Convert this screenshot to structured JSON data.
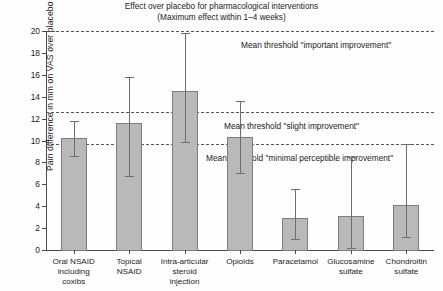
{
  "chart_data": {
    "type": "bar",
    "title": "Effect over placebo for pharmacological interventions",
    "subtitle": "(Maximum effect within 1–4 weeks)",
    "xlabel": "",
    "ylabel": "Pain difference in mm on VAS over placebo",
    "ylim": [
      0,
      20
    ],
    "yticks": [
      0,
      2,
      4,
      6,
      8,
      10,
      12,
      14,
      16,
      18,
      20
    ],
    "grid": false,
    "legend": "none",
    "categories": [
      "Oral NSAID including coxibs",
      "Topical NSAID",
      "Intra-articular steroid injection",
      "Opioids",
      "Paracetamol",
      "Glucosamine sulfate",
      "Chondroitin sulfate"
    ],
    "category_lines": [
      [
        "Oral NSAID",
        "including",
        "coxibs"
      ],
      [
        "Topical",
        "NSAID"
      ],
      [
        "Intra-articular",
        "steroid",
        "injection"
      ],
      [
        "Opioids"
      ],
      [
        "Paracetamol"
      ],
      [
        "Glucosamine",
        "sulfate"
      ],
      [
        "Chondroitin",
        "sulfate"
      ]
    ],
    "values": [
      10.2,
      11.6,
      14.5,
      10.3,
      2.9,
      3.1,
      4.1
    ],
    "error_low": [
      8.6,
      6.8,
      9.9,
      7.0,
      1.0,
      0.2,
      1.2
    ],
    "error_high": [
      11.8,
      15.8,
      19.8,
      13.6,
      5.6,
      8.5,
      9.7
    ],
    "annotations": [
      {
        "label": "Mean threshold \"important improvement\"",
        "value": 20.0
      },
      {
        "label": "Mean threshold \"slight improvement\"",
        "value": 12.6
      },
      {
        "label": "Mean threshold \"minimal perceptible improvement\"",
        "value": 9.7
      }
    ],
    "colors": {
      "bar_fill": "#b9b9b9",
      "bar_border": "#7d7d7d",
      "error_bar": "#6e6e6e",
      "axis": "#4a4a4a",
      "threshold": "#555555",
      "text": "#1b1b1b"
    }
  }
}
